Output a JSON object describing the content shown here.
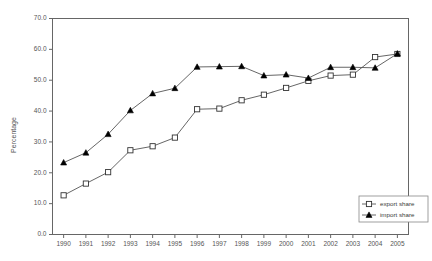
{
  "chart_data": {
    "type": "line",
    "title": "",
    "subtitle": "",
    "xlabel": "",
    "ylabel": "Percentage",
    "categories": [
      "1990",
      "1991",
      "1992",
      "1993",
      "1994",
      "1995",
      "1996",
      "1997",
      "1998",
      "1999",
      "2000",
      "2001",
      "2002",
      "2003",
      "2004",
      "2005"
    ],
    "x": [
      1990,
      1991,
      1992,
      1993,
      1994,
      1995,
      1996,
      1997,
      1998,
      1999,
      2000,
      2001,
      2002,
      2003,
      2004,
      2005
    ],
    "xlim": [
      1989.5,
      2005.5
    ],
    "ylim": [
      0.0,
      70.0
    ],
    "ytick_labels": [
      "0.0",
      "10.0",
      "20.0",
      "30.0",
      "40.0",
      "50.0",
      "60.0",
      "70.0"
    ],
    "ytick_values": [
      0.0,
      10.0,
      20.0,
      30.0,
      40.0,
      50.0,
      60.0,
      70.0
    ],
    "xtick_labels": [
      "1990",
      "1991",
      "1992",
      "1993",
      "1994",
      "1995",
      "1996",
      "1997",
      "1998",
      "1999",
      "2000",
      "2001",
      "2002",
      "2003",
      "2004",
      "2005"
    ],
    "grid": false,
    "legend_position": "bottom-right",
    "series": [
      {
        "name": "export share",
        "marker": "open-square",
        "color": "#555555",
        "values": [
          12.7,
          16.5,
          20.2,
          27.3,
          28.6,
          31.4,
          40.6,
          40.8,
          43.5,
          45.3,
          47.5,
          49.8,
          51.5,
          51.8,
          57.5,
          58.5
        ]
      },
      {
        "name": "import share",
        "marker": "filled-triangle",
        "color": "#555555",
        "values": [
          23.3,
          26.5,
          32.5,
          40.2,
          45.7,
          47.4,
          54.3,
          54.4,
          54.5,
          51.5,
          51.8,
          50.7,
          54.2,
          54.2,
          54.0,
          58.6
        ]
      }
    ]
  },
  "legend": {
    "items": [
      {
        "label": "export share",
        "marker": "open-square"
      },
      {
        "label": "import share",
        "marker": "filled-triangle"
      }
    ]
  },
  "colors": {
    "axis": "#555555",
    "line": "#555555",
    "marker_fill_open": "#ffffff",
    "marker_fill_solid": "#000000",
    "background": "#ffffff",
    "text": "#3a3a3a"
  }
}
